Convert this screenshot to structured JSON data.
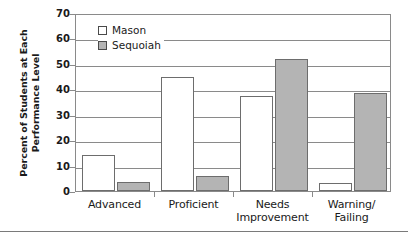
{
  "chart_data": {
    "type": "bar",
    "title": "",
    "xlabel": "",
    "ylabel": "Percent of Students at Each Performance Level",
    "ylabel_lines": [
      "Percent of Students at Each",
      "Performance Level"
    ],
    "ylim": [
      0,
      70
    ],
    "yticks": [
      0,
      10,
      20,
      30,
      40,
      50,
      60,
      70
    ],
    "ytick_labels": [
      "0",
      "10",
      "20",
      "30",
      "40",
      "50",
      "60",
      "70"
    ],
    "grid": true,
    "grid_axis": "y",
    "legend_position": "upper-left-inside",
    "categories": [
      "Advanced",
      "Proficient",
      "Needs Improvement",
      "Warning/ Failing"
    ],
    "category_lines": [
      [
        "Advanced"
      ],
      [
        "Proficient"
      ],
      [
        "Needs",
        "Improvement"
      ],
      [
        "Warning/",
        "Failing"
      ]
    ],
    "series": [
      {
        "name": "Mason",
        "color": "#ffffff",
        "edge_color": "#6d6d6d",
        "values": [
          14,
          45,
          37.5,
          3
        ]
      },
      {
        "name": "Sequoiah",
        "color": "#b4b4b4",
        "edge_color": "#6d6d6d",
        "values": [
          3.5,
          6,
          52,
          38.5
        ]
      }
    ]
  },
  "legend": {
    "items": [
      {
        "label": "Mason",
        "swatch": "mason"
      },
      {
        "label": "Sequoiah",
        "swatch": "sequoiah"
      }
    ]
  },
  "colors": {
    "axis": "#8a8a8a",
    "bar_edge": "#6d6d6d",
    "sequoiah_fill": "#b4b4b4",
    "mason_fill": "#ffffff",
    "text": "#1a1a1a"
  }
}
